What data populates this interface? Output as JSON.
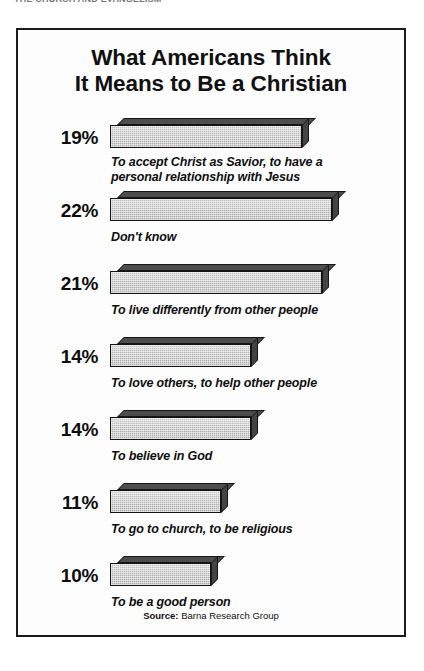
{
  "page": {
    "running_head": "THE CHURCH AND EVANGELISM"
  },
  "figure": {
    "title_line_1": "What Americans Think",
    "title_line_2": "It Means to Be a Christian",
    "source_label": "Source:",
    "source_value": "Barna Research Group"
  },
  "chart_data": {
    "type": "bar",
    "orientation": "horizontal",
    "title": "What Americans Think It Means to Be a Christian",
    "xlabel": "",
    "ylabel": "",
    "xlim": [
      0,
      22
    ],
    "grid": false,
    "legend": false,
    "value_suffix": "%",
    "source": "Source: Barna Research Group",
    "categories": [
      "To accept Christ as Savior, to have a personal relationship with Jesus",
      "Don't know",
      "To live differently from other people",
      "To love others, to help other people",
      "To believe in God",
      "To go to church, to be religious",
      "To be a good person"
    ],
    "values": [
      19,
      22,
      21,
      14,
      14,
      11,
      10
    ],
    "bars": [
      {
        "percent_label": "19%",
        "value": 19,
        "caption_line_1": "To accept Christ as Savior, to have a",
        "caption_line_2": "personal relationship with Jesus"
      },
      {
        "percent_label": "22%",
        "value": 22,
        "caption_line_1": "Don't know",
        "caption_line_2": ""
      },
      {
        "percent_label": "21%",
        "value": 21,
        "caption_line_1": "To live differently from other people",
        "caption_line_2": ""
      },
      {
        "percent_label": "14%",
        "value": 14,
        "caption_line_1": "To love others, to help other people",
        "caption_line_2": ""
      },
      {
        "percent_label": "14%",
        "value": 14,
        "caption_line_1": "To believe in God",
        "caption_line_2": ""
      },
      {
        "percent_label": "11%",
        "value": 11,
        "caption_line_1": "To go to church, to be religious",
        "caption_line_2": ""
      },
      {
        "percent_label": "10%",
        "value": 10,
        "caption_line_1": "To be a good person",
        "caption_line_2": ""
      }
    ],
    "colors": {
      "bar_front": "#b9b9b9",
      "bar_top": "#4d4d4d",
      "bar_side": "#444444",
      "outline": "#141414",
      "text": "#0f0f0f",
      "background": "#ffffff"
    }
  }
}
